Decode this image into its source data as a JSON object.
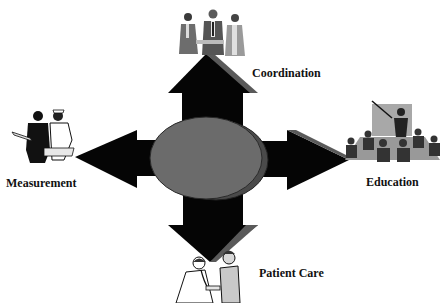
{
  "diagram": {
    "center": {
      "shape": "ellipse",
      "color": "#6b6b6b",
      "shadow_color": "#4a4a4a"
    },
    "arrow_color": "#050505",
    "bevel_color": "#5a5a5a",
    "nodes": [
      {
        "id": "coordination",
        "label": "Coordination",
        "direction": "up",
        "icon": "business-people-handshake-icon"
      },
      {
        "id": "education",
        "label": "Education",
        "direction": "right",
        "icon": "classroom-presentation-icon"
      },
      {
        "id": "patient_care",
        "label": "Patient Care",
        "direction": "down",
        "icon": "doctor-patient-stethoscope-icon"
      },
      {
        "id": "measurement",
        "label": "Measurement",
        "direction": "left",
        "icon": "nurses-reviewing-chart-icon"
      }
    ]
  }
}
